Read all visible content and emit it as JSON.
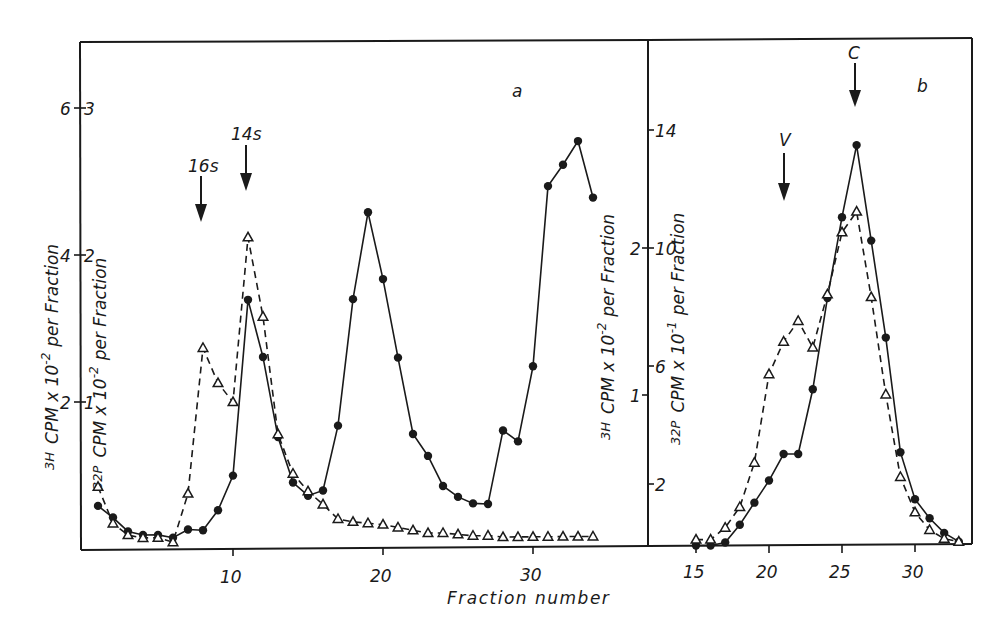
{
  "chart_data": [
    {
      "panel": "a",
      "type": "line",
      "panel_label": "a",
      "xlabel": "Fraction number",
      "x_ticks": [
        10,
        20,
        30
      ],
      "xlim": [
        0,
        35
      ],
      "ylabel_left": "3H  CPM x 10^-2 per Fraction",
      "ylabel_right": "32P  CPM x 10^-2 per Fraction",
      "y_ticks_3H": [
        2,
        4,
        6
      ],
      "y_ticks_32P": [
        1,
        2,
        3
      ],
      "ylim_3H": [
        0,
        7.5
      ],
      "ylim_32P": [
        0,
        3.75
      ],
      "annotations": [
        {
          "text": "16s",
          "fraction": 8,
          "type": "arrow"
        },
        {
          "text": "14s",
          "fraction": 11,
          "type": "arrow"
        }
      ],
      "series": [
        {
          "name": "3H (solid, filled circles)",
          "marker": "circle",
          "line": "solid",
          "axis": "3H",
          "x": [
            1,
            2,
            3,
            4,
            5,
            6,
            7,
            8,
            9,
            10,
            11,
            12,
            13,
            14,
            15,
            16,
            17,
            18,
            19,
            20,
            21,
            22,
            23,
            24,
            25,
            26,
            27,
            28,
            29,
            30,
            31,
            32,
            33,
            34
          ],
          "values": [
            0.6,
            0.44,
            0.25,
            0.2,
            0.2,
            0.16,
            0.27,
            0.26,
            0.53,
            1.0,
            3.39,
            2.61,
            1.52,
            0.9,
            0.72,
            0.79,
            1.67,
            3.39,
            4.57,
            3.66,
            2.59,
            1.55,
            1.25,
            0.84,
            0.69,
            0.6,
            0.59,
            1.59,
            1.44,
            2.46,
            4.91,
            5.2,
            5.52,
            4.75
          ]
        },
        {
          "name": "32P (dashed, open triangles)",
          "marker": "triangle",
          "line": "dashed",
          "axis": "32P",
          "x": [
            1,
            2,
            3,
            4,
            5,
            6,
            7,
            8,
            9,
            10,
            11,
            12,
            13,
            14,
            15,
            16,
            17,
            18,
            19,
            20,
            21,
            22,
            23,
            24,
            25,
            26,
            27,
            28,
            29,
            30,
            31,
            32,
            33,
            34
          ],
          "values": [
            0.43,
            0.18,
            0.1,
            0.08,
            0.08,
            0.05,
            0.38,
            1.37,
            1.13,
            1.0,
            2.12,
            1.58,
            0.78,
            0.51,
            0.39,
            0.3,
            0.2,
            0.18,
            0.17,
            0.16,
            0.14,
            0.12,
            0.1,
            0.1,
            0.09,
            0.08,
            0.08,
            0.07,
            0.07,
            0.07,
            0.07,
            0.07,
            0.07,
            0.07
          ]
        }
      ]
    },
    {
      "panel": "b",
      "type": "line",
      "panel_label": "b",
      "xlabel": "Fraction number",
      "x_ticks": [
        15,
        20,
        25,
        30
      ],
      "xlim": [
        14,
        33.5
      ],
      "ylabel_left": "3H  CPM x 10^-2 per Fraction",
      "ylabel_right": "32P  CPM x 10^-1 per Fraction",
      "y_ticks_3H": [
        1,
        2
      ],
      "y_ticks_32P": [
        2,
        6,
        10,
        14
      ],
      "ylim_3H": [
        0,
        2.7
      ],
      "ylim_32P": [
        0,
        15.8
      ],
      "annotations": [
        {
          "text": "V",
          "fraction": 21,
          "type": "arrow"
        },
        {
          "text": "C",
          "fraction": 26,
          "type": "arrow"
        }
      ],
      "series": [
        {
          "name": "3H (solid, filled circles)",
          "marker": "circle",
          "line": "solid",
          "axis": "3H",
          "x": [
            15,
            16,
            17,
            18,
            19,
            20,
            21,
            22,
            23,
            24,
            25,
            26,
            27,
            28,
            29,
            30,
            31,
            32,
            33
          ],
          "values": [
            0.0,
            0.0,
            0.02,
            0.14,
            0.29,
            0.44,
            0.62,
            0.62,
            1.06,
            1.68,
            2.23,
            2.72,
            2.07,
            1.41,
            0.63,
            0.31,
            0.18,
            0.08,
            0.02
          ]
        },
        {
          "name": "32P (dashed, open triangles)",
          "marker": "triangle",
          "line": "dashed",
          "axis": "32P",
          "x": [
            15,
            16,
            17,
            18,
            19,
            20,
            21,
            22,
            23,
            24,
            25,
            26,
            27,
            28,
            29,
            30,
            31,
            32,
            33
          ],
          "values": [
            0.2,
            0.2,
            0.6,
            1.3,
            2.8,
            5.8,
            6.9,
            7.6,
            6.7,
            8.5,
            10.6,
            11.3,
            8.4,
            5.1,
            2.3,
            1.1,
            0.5,
            0.2,
            0.1
          ]
        }
      ]
    }
  ],
  "labels": {
    "panel_a": "a",
    "panel_b": "b",
    "xlabel": "Fraction number",
    "ylabel_a_left_iso": "3H",
    "ylabel_a_left_rest": "CPM x 10",
    "ylabel_a_left_exp": "-2",
    "ylabel_a_left_tail": "per Fraction",
    "ylabel_a_right_iso": "32P",
    "ylabel_a_right_rest": "CPM x 10",
    "ylabel_a_right_exp": "-2",
    "ylabel_a_right_tail": "per Fraction",
    "ylabel_b_left_iso": "3H",
    "ylabel_b_left_rest": "CPM x 10",
    "ylabel_b_left_exp": "-2",
    "ylabel_b_left_tail": "per Fraction",
    "ylabel_b_right_iso": "32P",
    "ylabel_b_right_rest": "CPM x 10",
    "ylabel_b_right_exp": "-1",
    "ylabel_b_right_tail": "per Fraction",
    "arrow_16s": "16s",
    "arrow_14s": "14s",
    "arrow_V": "V",
    "arrow_C": "C",
    "a_tick_pairs": [
      "2",
      "1",
      "4",
      "2",
      "6",
      "3"
    ],
    "b_left_ticks": [
      "1",
      "2"
    ],
    "b_right_ticks": [
      "2",
      "6",
      "10",
      "14"
    ],
    "a_x_ticks": [
      "10",
      "20",
      "30"
    ],
    "b_x_ticks": [
      "15",
      "20",
      "25",
      "30"
    ]
  }
}
